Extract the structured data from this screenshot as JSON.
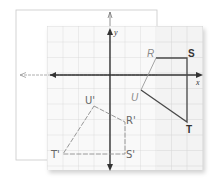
{
  "diagram": {
    "type": "coordinate-grid-reflection",
    "axes": {
      "x_label": "x",
      "y_label": "y"
    },
    "original_figure": {
      "vertices": [
        {
          "name": "R",
          "label": "R"
        },
        {
          "name": "S",
          "label": "S"
        },
        {
          "name": "T",
          "label": "T"
        },
        {
          "name": "U",
          "label": "U"
        }
      ]
    },
    "image_figure": {
      "vertices": [
        {
          "name": "U'",
          "label": "U'"
        },
        {
          "name": "R'",
          "label": "R'"
        },
        {
          "name": "S'",
          "label": "S'"
        },
        {
          "name": "T'",
          "label": "T'"
        }
      ]
    },
    "colors": {
      "grid_line": "#d9d9d9",
      "grid_bg": "#f7f7f7",
      "axis": "#333333",
      "figure": "#4a4a4a",
      "sketch": "#8c8c8c",
      "paper_outline": "#c8c8c8"
    }
  }
}
